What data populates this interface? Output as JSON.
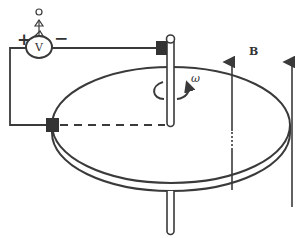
{
  "diagram": {
    "voltmeter": {
      "label": "V",
      "plus": "+",
      "minus": "−"
    },
    "omega_label": "ω",
    "field_label": "B",
    "colors": {
      "stroke": "#3a3a3a",
      "contact": "#333333",
      "background": "#ffffff"
    }
  }
}
